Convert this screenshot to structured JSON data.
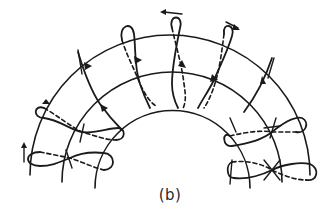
{
  "figure": {
    "caption": "(b)",
    "colors": {
      "ink": "#1a1a1a",
      "background": "#ffffff"
    },
    "arcs": [
      {
        "name": "outer-arc",
        "radius": 130
      },
      {
        "name": "middle-arc",
        "radius": 105
      },
      {
        "name": "inner-arc",
        "radius": 80
      }
    ],
    "loops_count": 7
  }
}
